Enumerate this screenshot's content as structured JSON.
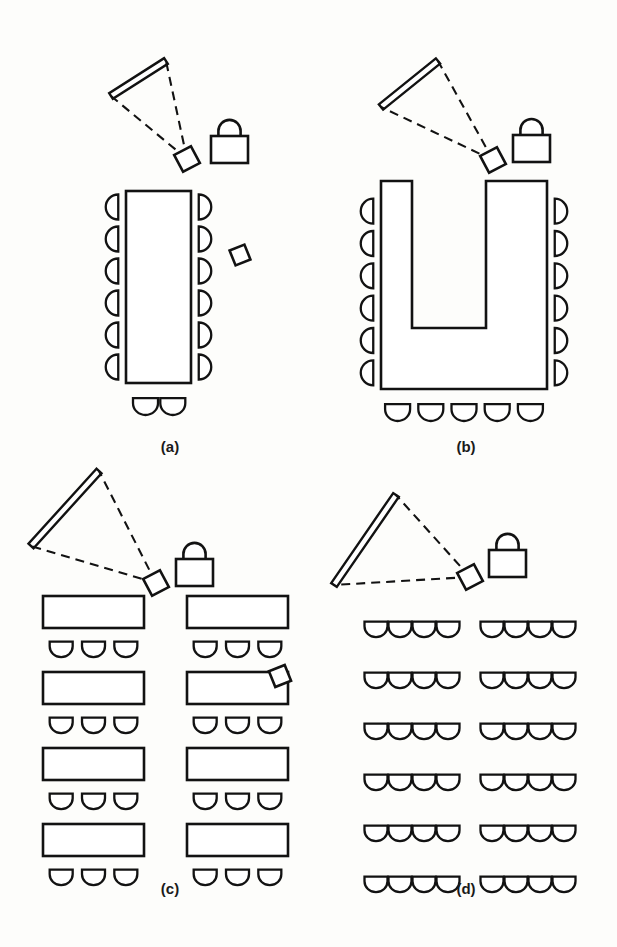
{
  "figure": {
    "background_color": "#fdfdfb",
    "ink_color": "#121212",
    "panel_count": 4
  },
  "panels": [
    {
      "id": "panel-a",
      "caption": "(a)",
      "caption_x": 170,
      "caption_y": 452,
      "arrangement": "conference-rectangular",
      "table_count": 1,
      "chair_count": 14,
      "has_free_projector": true,
      "screen": {
        "x1": 166,
        "y1": 61,
        "x2": 111,
        "y2": 96
      },
      "projector": {
        "cx": 187,
        "cy": 159,
        "size": 19,
        "rotation": -28
      },
      "free_projector": {
        "cx": 240,
        "cy": 255,
        "size": 16,
        "rotation": -22
      },
      "lectern": {
        "x": 211,
        "y": 136,
        "w": 37,
        "h": 27
      },
      "table": {
        "x": 126,
        "y": 191,
        "w": 65,
        "h": 192
      },
      "side_chairs_per_side": 6,
      "end_chairs": 2
    },
    {
      "id": "panel-b",
      "caption": "(b)",
      "caption_x": 466,
      "caption_y": 452,
      "arrangement": "u-shape",
      "table_count": 1,
      "chair_count": 17,
      "has_free_projector": false,
      "screen": {
        "x1": 438,
        "y1": 61,
        "x2": 381,
        "y2": 107
      },
      "projector": {
        "cx": 493,
        "cy": 160,
        "size": 19,
        "rotation": -28
      },
      "lectern": {
        "x": 513,
        "y": 135,
        "w": 37,
        "h": 27
      },
      "table_outer": {
        "x": 381,
        "y": 181,
        "w": 166,
        "h": 208
      },
      "table_inner": {
        "x": 412,
        "y": 181,
        "w": 74,
        "h": 147
      },
      "side_chairs_per_side": 6,
      "end_chairs": 5
    },
    {
      "id": "panel-c",
      "caption": "(c)",
      "caption_x": 170,
      "caption_y": 894,
      "arrangement": "classroom",
      "table_count": 8,
      "table_rows": 4,
      "table_cols": 2,
      "chairs_per_table": 3,
      "chair_count": 24,
      "has_free_projector": true,
      "screen": {
        "x1": 99,
        "y1": 471,
        "x2": 31,
        "y2": 546
      },
      "projector": {
        "cx": 156,
        "cy": 583,
        "size": 19,
        "rotation": -28
      },
      "lectern": {
        "x": 176,
        "y": 559,
        "w": 37,
        "h": 27
      },
      "attached_projector": {
        "cx": 280,
        "cy": 676,
        "size": 17,
        "rotation": -22
      },
      "attached_to": "row-2-right-table"
    },
    {
      "id": "panel-d",
      "caption": "(d)",
      "caption_x": 466,
      "caption_y": 894,
      "arrangement": "theater",
      "table_count": 0,
      "seat_rows": 6,
      "seats_left_block": 4,
      "seats_right_block": 4,
      "chair_count": 48,
      "has_free_projector": false,
      "screen": {
        "x1": 396,
        "y1": 495,
        "x2": 334,
        "y2": 585
      },
      "projector": {
        "cx": 470,
        "cy": 577,
        "size": 19,
        "rotation": -28
      },
      "lectern": {
        "x": 489,
        "y": 550,
        "w": 37,
        "h": 27
      }
    }
  ],
  "legend_symbols": [
    {
      "name": "screen",
      "description": "projection screen drawn as thick double line"
    },
    {
      "name": "beam",
      "description": "dashed projection beam from projector to screen"
    },
    {
      "name": "projector",
      "description": "small rotated square"
    },
    {
      "name": "lectern",
      "description": "rectangle with semicircular arch on top"
    },
    {
      "name": "chair-side",
      "description": "D-shaped half circle facing the table"
    },
    {
      "name": "chair-front",
      "description": "U-shaped half circle with flat top"
    },
    {
      "name": "table",
      "description": "open white rectangle"
    }
  ]
}
